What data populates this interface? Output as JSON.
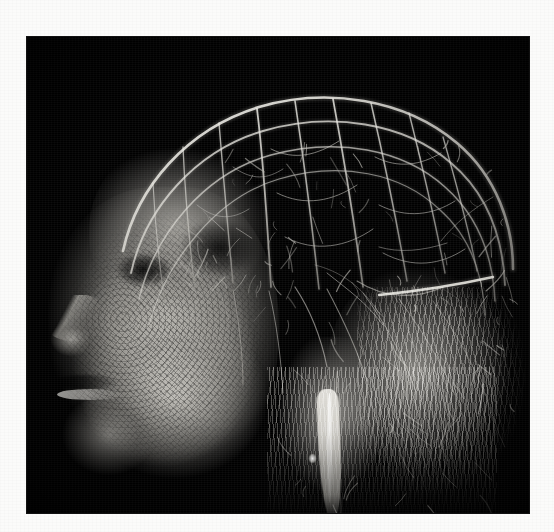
{
  "figure": {
    "kind": "volumetric-rendering",
    "modality": "grayscale 3D volume rendering",
    "caption": "",
    "orientation": "facing left",
    "panel": {
      "background_color": "#000000",
      "left": 27,
      "top": 37,
      "width": 502,
      "height": 476
    },
    "page": {
      "background_color": "#fbfbfa",
      "width": 554,
      "height": 532
    },
    "palette": {
      "background": "#000000",
      "vessel_bright": "#f0efe9",
      "vessel_mid": "#c8c6c0",
      "vessel_dim": "#8e8c87",
      "tissue_mid": "#a4a29c",
      "tissue_dark": "#56544f",
      "page_white": "#fbfbfa"
    },
    "regions": [
      {
        "id": "cranial-canopy",
        "label": "Cranial vessel canopy",
        "description": "dense arborizing superficial vessel network arching over the calvarium"
      },
      {
        "id": "facial-mass",
        "label": "Facial soft tissue mass",
        "description": "bright granular tissue block forming brow, nose, lips and chin in profile"
      },
      {
        "id": "nose-profile",
        "label": "Nasal profile",
        "description": "protruding nose silhouette at the anterior-inferior left margin"
      },
      {
        "id": "lip-profile",
        "label": "Lip line",
        "description": "bright horizontal sliver marking the mouth opening"
      },
      {
        "id": "chin-profile",
        "label": "Mandible and chin",
        "description": "rounded inferior-anterior tissue lobe"
      },
      {
        "id": "orbital-shadow",
        "label": "Orbital void",
        "description": "dark elliptical region corresponding to the orbit"
      },
      {
        "id": "temporal-region",
        "label": "Temporal vessel plexus",
        "description": "fine branching network over the temple"
      },
      {
        "id": "occipital-region",
        "label": "Occipital vessel field",
        "description": "posterior arborization with long trailing branches"
      },
      {
        "id": "carotid-trunk",
        "label": "Descending vascular trunk",
        "description": "bright tapering vertical vessel descending toward the neck"
      },
      {
        "id": "inferior-fringe",
        "label": "Inferior vessel fringe",
        "description": "downward hanging fine capillary fringe below the head"
      }
    ],
    "vessels": {
      "arcs": [
        {
          "d": "M96,214 C110,150 160,92 232,70 C300,50 378,62 430,106 C470,140 486,188 486,232",
          "w": 2.6,
          "o": 0.92
        },
        {
          "d": "M104,236 C118,172 168,114 236,94 C304,74 378,86 424,126 C462,158 476,204 478,248",
          "w": 1.9,
          "o": 0.78
        },
        {
          "d": "M112,262 C128,196 178,136 244,118 C310,100 376,112 418,150 C452,180 466,222 468,264",
          "w": 1.5,
          "o": 0.66
        },
        {
          "d": "M122,288 C140,222 190,160 252,142 C314,124 374,136 412,172 C444,200 456,238 458,278",
          "w": 1.2,
          "o": 0.55
        }
      ],
      "radials": [
        {
          "d": "M230,72 C236,120 240,180 244,250",
          "w": 1.8,
          "o": 0.82
        },
        {
          "d": "M268,64 C276,118 284,178 292,252",
          "w": 1.6,
          "o": 0.78
        },
        {
          "d": "M306,62 C316,116 326,176 336,250",
          "w": 1.7,
          "o": 0.8
        },
        {
          "d": "M344,66 C356,118 368,174 380,244",
          "w": 1.5,
          "o": 0.74
        },
        {
          "d": "M382,76 C394,124 406,172 418,236",
          "w": 1.4,
          "o": 0.7
        },
        {
          "d": "M416,100 C428,142 440,184 450,234",
          "w": 1.3,
          "o": 0.66
        },
        {
          "d": "M192,86 C196,134 200,184 206,246",
          "w": 1.4,
          "o": 0.7
        },
        {
          "d": "M156,110 C158,156 162,202 168,254",
          "w": 1.3,
          "o": 0.64
        },
        {
          "d": "M126,146 C128,188 132,226 138,266",
          "w": 1.1,
          "o": 0.56
        }
      ],
      "branches": [
        {
          "d": "M244,112 C268,124 290,118 312,104",
          "w": 1.0,
          "o": 0.6
        },
        {
          "d": "M250,156 C278,170 306,164 330,148",
          "w": 1.0,
          "o": 0.58
        },
        {
          "d": "M258,200 C288,216 320,210 346,192",
          "w": 1.0,
          "o": 0.56
        },
        {
          "d": "M206,130 C226,144 240,142 256,132",
          "w": 0.9,
          "o": 0.52
        },
        {
          "d": "M170,168 C190,184 206,182 222,172",
          "w": 0.9,
          "o": 0.5
        },
        {
          "d": "M348,120 C372,132 394,128 414,116",
          "w": 1.0,
          "o": 0.58
        },
        {
          "d": "M352,168 C380,182 406,178 428,164",
          "w": 1.0,
          "o": 0.56
        },
        {
          "d": "M356,216 C386,232 414,228 438,212",
          "w": 1.0,
          "o": 0.54
        },
        {
          "d": "M330,244 C358,262 390,262 416,250",
          "w": 1.1,
          "o": 0.58
        },
        {
          "d": "M300,236 C320,252 340,266 356,288",
          "w": 1.0,
          "o": 0.54
        },
        {
          "d": "M268,250 C284,274 294,300 300,330",
          "w": 1.2,
          "o": 0.62
        },
        {
          "d": "M300,252 C316,282 330,312 340,344",
          "w": 1.1,
          "o": 0.58
        },
        {
          "d": "M336,256 C358,286 376,318 388,352",
          "w": 1.0,
          "o": 0.54
        },
        {
          "d": "M372,262 C394,292 414,324 428,358",
          "w": 1.0,
          "o": 0.52
        },
        {
          "d": "M406,264 C428,294 446,326 458,358",
          "w": 0.9,
          "o": 0.48
        },
        {
          "d": "M242,254 C250,288 254,322 256,356",
          "w": 1.0,
          "o": 0.54
        },
        {
          "d": "M206,252 C212,286 216,318 216,348",
          "w": 0.9,
          "o": 0.48
        },
        {
          "d": "M352,276 C334,248 312,234 288,228",
          "w": 0.8,
          "o": 0.44
        },
        {
          "d": "M420,206 C396,214 372,216 352,210",
          "w": 0.9,
          "o": 0.5
        },
        {
          "d": "M466,160 C446,172 428,186 414,204",
          "w": 0.9,
          "o": 0.48
        }
      ],
      "long_horizontal": {
        "d": "M352,258 C392,254 430,248 466,240",
        "w": 2.4,
        "o": 0.88
      },
      "twigs": 150
    }
  }
}
